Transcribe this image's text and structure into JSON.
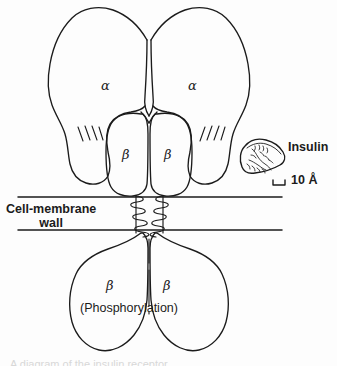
{
  "figure": {
    "background_color": "#fdfdfd",
    "stroke_color": "#1b1b1b",
    "labels": {
      "alpha_left": "α",
      "alpha_right": "α",
      "beta_upper_left": "β",
      "beta_upper_right": "β",
      "beta_lower_left": "β",
      "beta_lower_right": "β",
      "phosphorylation": "(Phosphorylation)",
      "membrane_line1": "Cell-membrane",
      "membrane_line2": "wall",
      "insulin": "Insulin",
      "scale_value": "10 Å"
    },
    "structures": {
      "alpha_subunit_count": 2,
      "beta_subunit_upper_count": 2,
      "beta_subunit_lower_count": 2,
      "hatch_mark_count_left": 4,
      "hatch_mark_count_right": 4,
      "transmembrane_helix_count": 2,
      "membrane_line_count": 2
    },
    "caption_cut": "A diagram of the insulin receptor"
  }
}
